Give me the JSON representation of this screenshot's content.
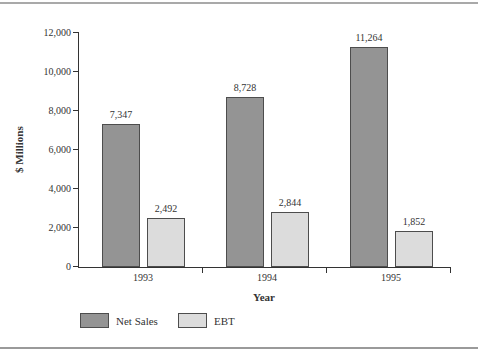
{
  "chart_data": {
    "type": "bar",
    "title": "",
    "xlabel": "Year",
    "ylabel": "$ Millions",
    "categories": [
      "1993",
      "1994",
      "1995"
    ],
    "series": [
      {
        "name": "Net Sales",
        "values": [
          7347,
          8728,
          11264
        ],
        "labels": [
          "7,347",
          "8,728",
          "11,264"
        ],
        "color": "#949494"
      },
      {
        "name": "EBT",
        "values": [
          2492,
          2844,
          1852
        ],
        "labels": [
          "2,492",
          "2,844",
          "1,852"
        ],
        "color": "#dcdcdc"
      }
    ],
    "ylim": [
      0,
      12000
    ],
    "ytick_step": 2000,
    "ytick_labels": [
      "0",
      "2,000",
      "4,000",
      "6,000",
      "8,000",
      "10,000",
      "12,000"
    ],
    "grid": false,
    "legend_position": "bottom",
    "bar_border_color": "#4d4d4d",
    "axis_color": "#333333",
    "text_color": "#333333"
  }
}
